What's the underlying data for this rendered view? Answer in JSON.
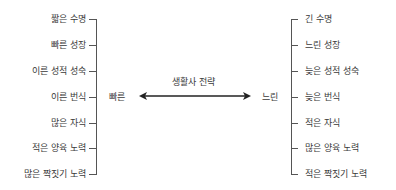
{
  "title": "생활사 전략",
  "left_pole": "빠른",
  "right_pole": "느린",
  "left_traits": [
    "짧은 수명",
    "빠른 성장",
    "이른 성적 성숙",
    "이른 번식",
    "많은 자식",
    "적은 양육 노력",
    "많은 짝짓기 노력"
  ],
  "right_traits": [
    "긴 수명",
    "느린 성장",
    "늦은 성적 성숙",
    "늦은 번식",
    "적은 자식",
    "많은 양육 노력",
    "적은 짝짓기 노력"
  ],
  "colors": {
    "line": "#555555",
    "text": "#3a3a3a",
    "arrow": "#222222"
  }
}
